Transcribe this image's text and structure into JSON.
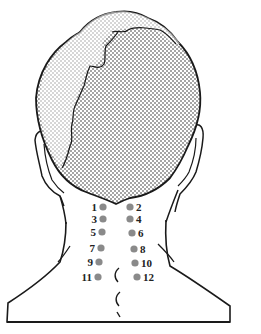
{
  "diagram": {
    "dot_color": "#8a8a8a",
    "line_color": "#1a1a1a",
    "hair_fill": "dotted",
    "points": [
      {
        "label": "1",
        "side": "left",
        "x": 103,
        "y": 207
      },
      {
        "label": "2",
        "side": "right",
        "x": 130,
        "y": 207
      },
      {
        "label": "3",
        "side": "left",
        "x": 103,
        "y": 219
      },
      {
        "label": "4",
        "side": "right",
        "x": 130,
        "y": 219
      },
      {
        "label": "5",
        "side": "left",
        "x": 102,
        "y": 232
      },
      {
        "label": "6",
        "side": "right",
        "x": 132,
        "y": 233
      },
      {
        "label": "7",
        "side": "left",
        "x": 101,
        "y": 248
      },
      {
        "label": "8",
        "side": "right",
        "x": 134,
        "y": 249
      },
      {
        "label": "9",
        "side": "left",
        "x": 99,
        "y": 262
      },
      {
        "label": "10",
        "side": "right",
        "x": 135,
        "y": 263
      },
      {
        "label": "11",
        "side": "left",
        "x": 98,
        "y": 277
      },
      {
        "label": "12",
        "side": "right",
        "x": 137,
        "y": 277
      }
    ]
  }
}
